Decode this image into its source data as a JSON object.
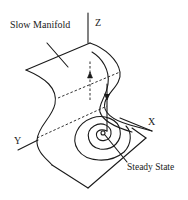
{
  "diagram": {
    "type": "3d-phase-space-schematic",
    "labels": {
      "manifold": "Slow Manifold",
      "z_axis": "Z",
      "x_axis": "X",
      "y_axis": "Y",
      "steady_state": "Steady State"
    },
    "colors": {
      "ink": "#1a1a1a",
      "background": "#ffffff"
    },
    "elements": [
      "folded slow-manifold surface",
      "Z, X, Y coordinate axes",
      "dashed fast-jump trajectory with upward arrow",
      "solid trajectory descending with downward arrow",
      "spiral converging to steady state",
      "dashed construction lines across the fold"
    ]
  }
}
